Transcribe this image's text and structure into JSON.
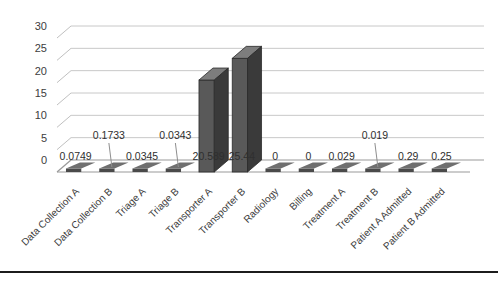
{
  "chart_data": {
    "type": "bar",
    "title": "",
    "subtitle": "",
    "xlabel": "",
    "ylabel": "",
    "ylim": [
      0,
      30
    ],
    "yticks": [
      0,
      5,
      10,
      15,
      20,
      25,
      30
    ],
    "grid": true,
    "legend": false,
    "style": "3d-column",
    "bar_color": "#595959",
    "categories": [
      "Data Collection A",
      "Data Collection B",
      "Triage A",
      "Triage B",
      "Transporter A",
      "Transporter B",
      "Radiology",
      "Billing",
      "Treatment A",
      "Treatment B",
      "Patient A Admitted",
      "Patient B Admitted"
    ],
    "values": [
      0.0749,
      0.1733,
      0.0345,
      0.0343,
      20.589,
      25.44,
      0,
      0,
      0.029,
      0.019,
      0.29,
      0.25
    ],
    "value_labels": [
      "0.0749",
      "0.1733",
      "0.0345",
      "0.0343",
      "20.589",
      "25.44",
      "0",
      "0",
      "0.029",
      "0.019",
      "0.29",
      "0.25"
    ],
    "label_rows": [
      0,
      1,
      0,
      1,
      0,
      0,
      0,
      0,
      0,
      1,
      0,
      0
    ]
  },
  "axis": {
    "ytick_labels": [
      "0",
      "5",
      "10",
      "15",
      "20",
      "25",
      "30"
    ]
  }
}
